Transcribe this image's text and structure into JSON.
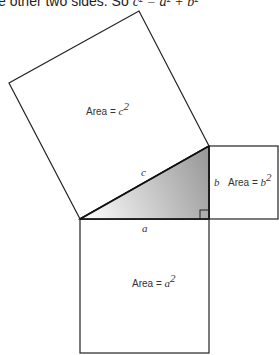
{
  "caption": {
    "text": "e other two sides. So ",
    "equation": "c² = a² + b²"
  },
  "diagram": {
    "square_c_label": "Area = ",
    "square_c_var": "c",
    "square_b_label": "Area = ",
    "square_b_var": "b",
    "square_a_label": "Area = ",
    "square_a_var": "a",
    "side_c": "c",
    "side_b": "b",
    "side_a": "a",
    "exponent": "2",
    "triangle_fill_start": "#ffffff",
    "triangle_fill_end": "#9a9a9a"
  }
}
